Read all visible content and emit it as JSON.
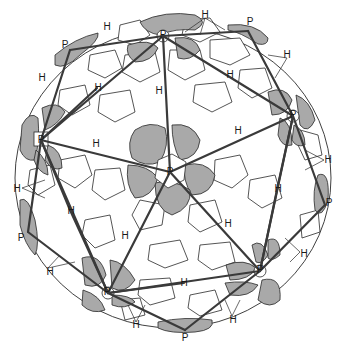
{
  "diagram": {
    "colors": {
      "pentamer_fill": "#a9a9a9",
      "hexamer_fill": "#ffffff",
      "outline": "#2a2a2a",
      "edge": "#3a3a3a"
    },
    "labels": [
      {
        "text": "P",
        "x": 65,
        "y": 45
      },
      {
        "text": "H",
        "x": 107,
        "y": 27
      },
      {
        "text": "P",
        "x": 163,
        "y": 35
      },
      {
        "text": "H",
        "x": 205,
        "y": 15
      },
      {
        "text": "P",
        "x": 250,
        "y": 22
      },
      {
        "text": "H",
        "x": 287,
        "y": 55
      },
      {
        "text": "H",
        "x": 42,
        "y": 78
      },
      {
        "text": "H",
        "x": 98,
        "y": 88
      },
      {
        "text": "H",
        "x": 159,
        "y": 91
      },
      {
        "text": "H",
        "x": 230,
        "y": 75
      },
      {
        "text": "P",
        "x": 41,
        "y": 140
      },
      {
        "text": "H",
        "x": 96,
        "y": 144
      },
      {
        "text": "P",
        "x": 293,
        "y": 115
      },
      {
        "text": "H",
        "x": 238,
        "y": 131
      },
      {
        "text": "P",
        "x": 170,
        "y": 172
      },
      {
        "text": "H",
        "x": 17,
        "y": 189
      },
      {
        "text": "H",
        "x": 71,
        "y": 211
      },
      {
        "text": "H",
        "x": 328,
        "y": 160
      },
      {
        "text": "H",
        "x": 278,
        "y": 189
      },
      {
        "text": "H",
        "x": 125,
        "y": 236
      },
      {
        "text": "H",
        "x": 228,
        "y": 224
      },
      {
        "text": "P",
        "x": 329,
        "y": 203
      },
      {
        "text": "P",
        "x": 21,
        "y": 238
      },
      {
        "text": "H",
        "x": 50,
        "y": 272
      },
      {
        "text": "P",
        "x": 107,
        "y": 292
      },
      {
        "text": "H",
        "x": 184,
        "y": 283
      },
      {
        "text": "P",
        "x": 260,
        "y": 270
      },
      {
        "text": "H",
        "x": 304,
        "y": 254
      },
      {
        "text": "H",
        "x": 233,
        "y": 320
      },
      {
        "text": "H",
        "x": 136,
        "y": 325
      },
      {
        "text": "P",
        "x": 185,
        "y": 338
      }
    ]
  }
}
